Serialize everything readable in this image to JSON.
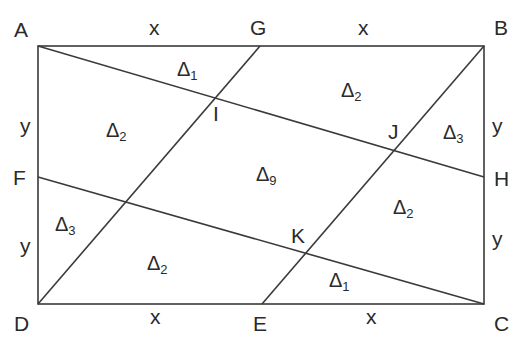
{
  "diagram": {
    "type": "geometry",
    "line_color": "#3a3a3a",
    "points": {
      "A": {
        "label": "A"
      },
      "G": {
        "label": "G"
      },
      "B": {
        "label": "B"
      },
      "F": {
        "label": "F"
      },
      "H": {
        "label": "H"
      },
      "D": {
        "label": "D"
      },
      "E": {
        "label": "E"
      },
      "C": {
        "label": "C"
      },
      "I": {
        "label": "I"
      },
      "J": {
        "label": "J"
      },
      "K": {
        "label": "K"
      }
    },
    "side_labels": {
      "AG": "x",
      "GB": "x",
      "DE": "x",
      "EC": "x",
      "AF": "y",
      "FD": "y",
      "BH": "y",
      "HC": "y"
    },
    "regions": [
      {
        "symbol": "Δ",
        "sub": "1",
        "pos": "top-left-upper"
      },
      {
        "symbol": "Δ",
        "sub": "2",
        "pos": "top-right"
      },
      {
        "symbol": "Δ",
        "sub": "2",
        "pos": "left-upper"
      },
      {
        "symbol": "Δ",
        "sub": "3",
        "pos": "right-upper"
      },
      {
        "symbol": "Δ",
        "sub": "9",
        "pos": "center"
      },
      {
        "symbol": "Δ",
        "sub": "2",
        "pos": "right-lower"
      },
      {
        "symbol": "Δ",
        "sub": "3",
        "pos": "left-lower"
      },
      {
        "symbol": "Δ",
        "sub": "2",
        "pos": "bottom-left"
      },
      {
        "symbol": "Δ",
        "sub": "1",
        "pos": "bottom-right-lower"
      }
    ]
  }
}
